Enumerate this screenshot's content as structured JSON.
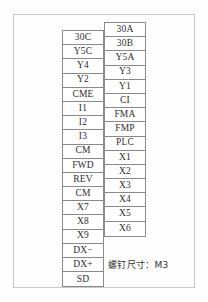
{
  "figure": {
    "kind": "vfd-terminal-block-diagram",
    "border_color": "#c9c9c9",
    "cell_border_color": "#8a8a8a",
    "text_color": "#2e2e2e",
    "background_color": "#fdfdfd"
  },
  "terminal_block": {
    "left_column": {
      "name": "left-terminal-row",
      "terminals": [
        "30C",
        "Y5C",
        "Y4",
        "Y2",
        "CME",
        "I1",
        "I2",
        "I3",
        "CM",
        "FWD",
        "REV",
        "CM",
        "X7",
        "X8",
        "X9",
        "DX−",
        "DX+",
        "SD"
      ]
    },
    "right_column": {
      "name": "right-terminal-row",
      "terminals": [
        "30A",
        "30B",
        "Y5A",
        "Y3",
        "Y1",
        "CI",
        "FMA",
        "FMP",
        "PLC",
        "X1",
        "X2",
        "X3",
        "X4",
        "X5",
        "X6"
      ]
    }
  },
  "annotations": {
    "screw_size_note": "螺钉尺寸：M3"
  }
}
